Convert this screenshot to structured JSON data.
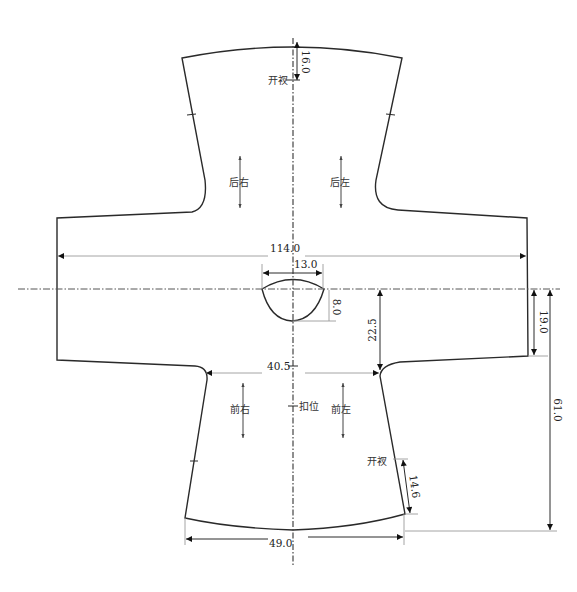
{
  "diagram": {
    "type": "garment-pattern",
    "pieces": {
      "back_right": "后右",
      "back_left": "后左",
      "front_right": "前右",
      "front_left": "前左"
    },
    "markers": {
      "back_slit": "开衩",
      "side_slit": "开衩",
      "button_position": "扣位"
    },
    "dimensions": {
      "total_sleeve_span": "114.0",
      "neck_width": "13.0",
      "neck_depth": "8.0",
      "chest_width": "40.5",
      "underarm_depth": "22.5",
      "sleeve_width": "19.0",
      "front_length": "61.0",
      "hem_width": "49.0",
      "side_slit_length": "14.6",
      "back_slit_length": "16.0"
    },
    "colors": {
      "outline": "#2a2a2a",
      "dimension_line": "#9a9a9a",
      "background": "#ffffff"
    }
  }
}
